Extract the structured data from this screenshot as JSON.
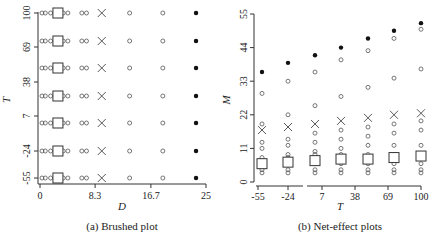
{
  "chart_data": [
    {
      "type": "scatter",
      "caption": "(a) Brushed plot",
      "xlabel": "D",
      "ylabel": "T",
      "xticks": [
        "0",
        "8.3",
        "16.7",
        "25"
      ],
      "yticks": [
        "-55",
        "-24",
        "7",
        "38",
        "69",
        "100"
      ],
      "xlim": [
        0,
        25
      ],
      "rows_T": [
        -55,
        -24,
        7,
        38,
        69,
        100,
        100
      ],
      "row_values_T": [
        100,
        69,
        38,
        7,
        -24,
        -55,
        -55
      ],
      "D_points_per_row": {
        "open_circles": [
          0.3,
          0.8,
          1.6,
          3.5,
          4.2,
          6.3,
          7.0,
          13.5,
          18.5
        ],
        "square": 2.7,
        "cross": 9.3,
        "filled_circle": 23.5
      },
      "grid": false
    },
    {
      "type": "scatter",
      "caption": "(b) Net-effect plots",
      "xlabel": "T",
      "ylabel": "M",
      "xticks": [
        "-55",
        "-24",
        "7",
        "38",
        "69",
        "100"
      ],
      "yticks": [
        "0",
        "11",
        "22",
        "33",
        "44",
        "55"
      ],
      "ylim": [
        0,
        55
      ],
      "x": [
        -55,
        -24,
        7,
        38,
        69,
        100
      ],
      "series": [
        {
          "name": "filled",
          "marker": "filled-circle",
          "values": [
            36,
            39,
            41.5,
            44,
            47,
            49.5,
            52
          ]
        },
        {
          "name": "cross",
          "marker": "x",
          "values": [
            17,
            18,
            19,
            20,
            21,
            22,
            22.5
          ]
        },
        {
          "name": "square",
          "marker": "square",
          "values": [
            6,
            6.5,
            7,
            7.5,
            7.5,
            8,
            8.5
          ]
        }
      ],
      "columns_T": [
        -55,
        -24,
        7,
        38,
        69,
        100,
        100
      ],
      "open_circle_columns": [
        [
          29,
          19,
          13,
          11,
          8,
          6,
          4,
          3
        ],
        [
          33,
          22,
          14,
          12,
          9,
          8,
          6,
          4,
          3
        ],
        [
          36,
          25,
          16,
          13,
          10,
          9,
          6,
          4,
          3
        ],
        [
          40,
          28,
          17,
          14,
          11,
          9,
          6,
          4,
          3
        ],
        [
          43,
          31,
          18,
          15,
          12,
          9,
          6,
          4,
          3
        ],
        [
          47,
          34,
          19,
          16,
          12,
          9,
          6,
          4,
          3
        ],
        [
          50,
          37,
          20,
          17,
          12,
          9,
          6,
          4,
          3
        ]
      ],
      "grid": false
    }
  ]
}
